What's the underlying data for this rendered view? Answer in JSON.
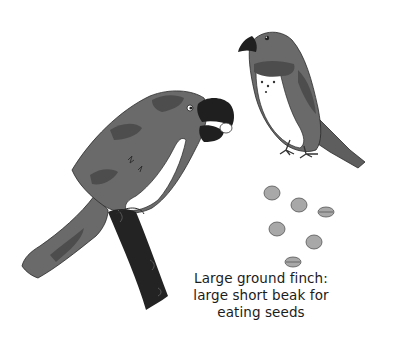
{
  "illustration": {
    "subject": "Large ground finch",
    "elements": [
      "large-finch-on-branch",
      "small-finch-standing",
      "seeds"
    ],
    "seed_count": 6,
    "colors": {
      "body": "#6a6a6a",
      "body_dark": "#4d4d4d",
      "beak": "#1f1f1f",
      "branch": "#232323",
      "chest": "#ffffff",
      "seed": "#a8a8a8"
    }
  },
  "caption": {
    "line1": "Large ground finch:",
    "line2": "large short beak for",
    "line3": "eating seeds"
  }
}
